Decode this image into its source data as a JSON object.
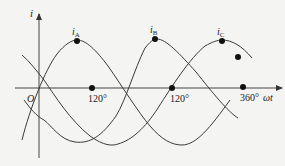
{
  "figure": {
    "axes": {
      "y_label": "i",
      "x_label": "ωt",
      "origin_label": "O"
    },
    "curves": [
      {
        "name": "i_A",
        "label_main": "i",
        "label_sub": "A"
      },
      {
        "name": "i_B",
        "label_main": "i",
        "label_sub": "B"
      },
      {
        "name": "i_C",
        "label_main": "i",
        "label_sub": "C"
      }
    ],
    "tick_labels": [
      {
        "text": "120°"
      },
      {
        "text": "120°"
      },
      {
        "text": "360°"
      }
    ],
    "colors": {
      "line": "#3a3a3a",
      "dot": "#111111",
      "background": "#f4f4f2"
    }
  }
}
